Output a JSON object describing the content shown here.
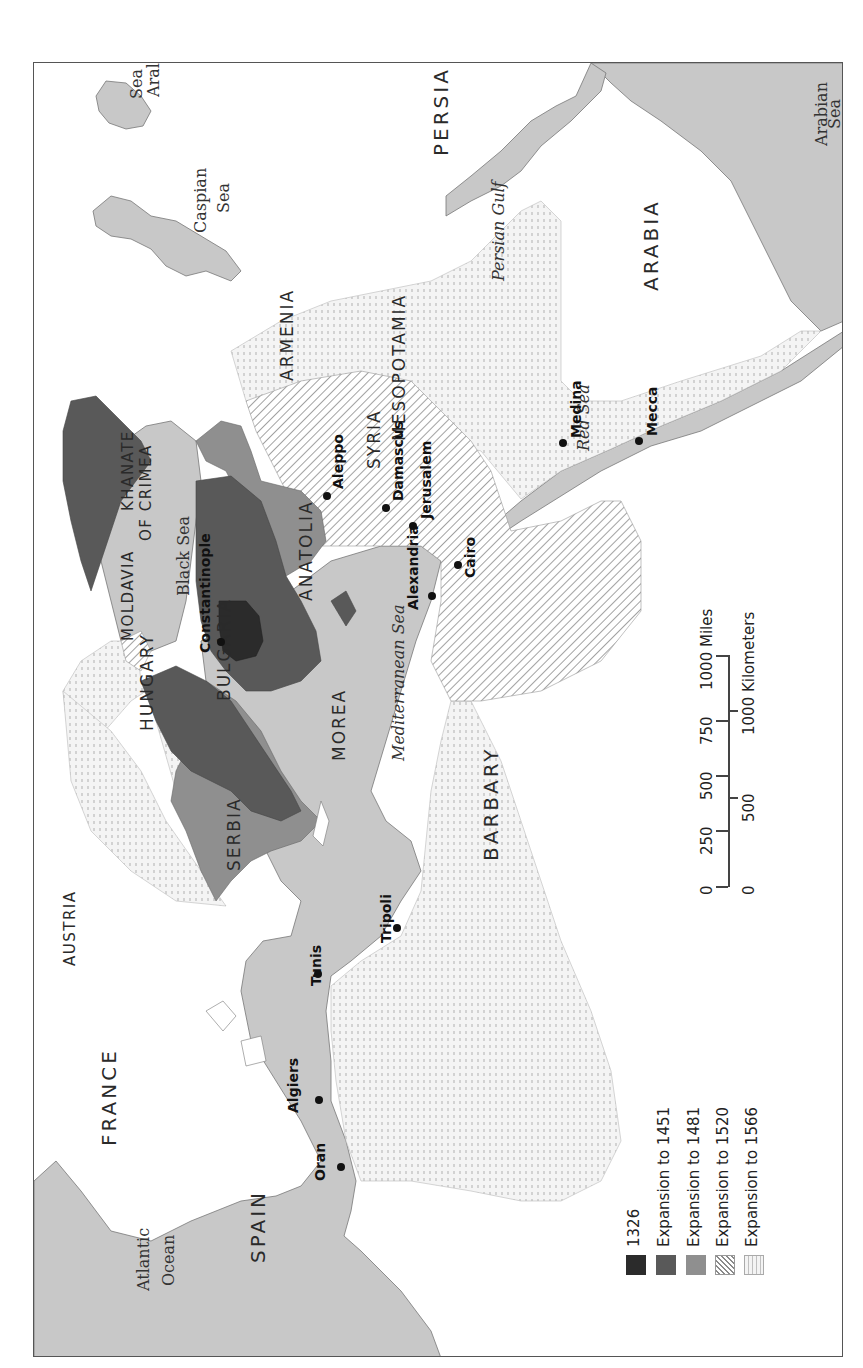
{
  "map": {
    "title_hidden": "",
    "orientation": "rotated-90-ccw",
    "colors": {
      "land": "#ffffff",
      "water": "#c8c8c8",
      "c1326": "#2b2b2b",
      "c1451": "#595959",
      "c1481": "#8f8f8f",
      "border": "#555555"
    },
    "regions": [
      {
        "name": "PERSIA",
        "x": 430,
        "y": 155,
        "cls": "big"
      },
      {
        "name": "ARABIA",
        "x": 640,
        "y": 290,
        "cls": "big"
      },
      {
        "name": "MESOPOTAMIA",
        "x": 390,
        "y": 440,
        "cls": ""
      },
      {
        "name": "ARMENIA",
        "x": 278,
        "y": 380,
        "cls": ""
      },
      {
        "name": "SYRIA",
        "x": 365,
        "y": 468,
        "cls": ""
      },
      {
        "name": "KHANATE",
        "x": 120,
        "y": 510,
        "cls": "sm"
      },
      {
        "name": "OF CRIMEA",
        "x": 138,
        "y": 540,
        "cls": "sm"
      },
      {
        "name": "ANATOLIA",
        "x": 297,
        "y": 600,
        "cls": ""
      },
      {
        "name": "MOLDAVIA",
        "x": 120,
        "y": 640,
        "cls": "sm"
      },
      {
        "name": "HUNGARY",
        "x": 138,
        "y": 730,
        "cls": ""
      },
      {
        "name": "BULGARIA",
        "x": 215,
        "y": 700,
        "cls": ""
      },
      {
        "name": "MOREA",
        "x": 330,
        "y": 760,
        "cls": ""
      },
      {
        "name": "SERBIA",
        "x": 225,
        "y": 870,
        "cls": ""
      },
      {
        "name": "AUSTRIA",
        "x": 62,
        "y": 965,
        "cls": "sm"
      },
      {
        "name": "BARBARY",
        "x": 480,
        "y": 860,
        "cls": "big"
      },
      {
        "name": "FRANCE",
        "x": 98,
        "y": 1145,
        "cls": "big"
      },
      {
        "name": "SPAIN",
        "x": 247,
        "y": 1262,
        "cls": "big"
      }
    ],
    "seas": [
      {
        "name": "Aral",
        "x": 145,
        "y": 96,
        "it": false
      },
      {
        "name": "Sea",
        "x": 128,
        "y": 98,
        "it": false
      },
      {
        "name": "Caspian",
        "x": 192,
        "y": 232,
        "it": false
      },
      {
        "name": "Sea",
        "x": 215,
        "y": 212,
        "it": false
      },
      {
        "name": "Persian Gulf",
        "x": 490,
        "y": 280,
        "it": true
      },
      {
        "name": "Arabian",
        "x": 813,
        "y": 145,
        "it": false
      },
      {
        "name": "Sea",
        "x": 826,
        "y": 128,
        "it": false
      },
      {
        "name": "Red Sea",
        "x": 575,
        "y": 450,
        "it": true
      },
      {
        "name": "Black Sea",
        "x": 175,
        "y": 595,
        "it": false
      },
      {
        "name": "Mediterranean Sea",
        "x": 390,
        "y": 760,
        "it": true
      },
      {
        "name": "Atlantic",
        "x": 135,
        "y": 1290,
        "it": false
      },
      {
        "name": "Ocean",
        "x": 160,
        "y": 1285,
        "it": false
      }
    ],
    "cities": [
      {
        "name": "Medina",
        "dot_x": 562,
        "dot_y": 442,
        "x": 568,
        "y": 437
      },
      {
        "name": "Mecca",
        "dot_x": 638,
        "dot_y": 440,
        "x": 644,
        "y": 435
      },
      {
        "name": "Aleppo",
        "dot_x": 326,
        "dot_y": 495,
        "x": 330,
        "y": 488
      },
      {
        "name": "Damascus",
        "dot_x": 385,
        "dot_y": 507,
        "x": 390,
        "y": 500
      },
      {
        "name": "Jerusalem",
        "dot_x": 412,
        "dot_y": 525,
        "x": 418,
        "y": 518
      },
      {
        "name": "Cairo",
        "dot_x": 457,
        "dot_y": 564,
        "x": 462,
        "y": 577
      },
      {
        "name": "Alexandria",
        "dot_x": 431,
        "dot_y": 595,
        "x": 405,
        "y": 609
      },
      {
        "name": "Constantinople",
        "dot_x": 220,
        "dot_y": 641,
        "x": 197,
        "y": 652
      },
      {
        "name": "Tripoli",
        "dot_x": 396,
        "dot_y": 927,
        "x": 378,
        "y": 942
      },
      {
        "name": "Tunis",
        "dot_x": 317,
        "dot_y": 973,
        "x": 308,
        "y": 985
      },
      {
        "name": "Algiers",
        "dot_x": 318,
        "dot_y": 1099,
        "x": 285,
        "y": 1112
      },
      {
        "name": "Oran",
        "dot_x": 340,
        "dot_y": 1166,
        "x": 312,
        "y": 1180
      }
    ]
  },
  "legend": {
    "items": [
      {
        "label": "1326",
        "key": "1326"
      },
      {
        "label": "Expansion to 1451",
        "key": "1451"
      },
      {
        "label": "Expansion to 1481",
        "key": "1481"
      },
      {
        "label": "Expansion to 1520",
        "key": "1520"
      },
      {
        "label": "Expansion to 1566",
        "key": "1566"
      }
    ]
  },
  "scale_bar": {
    "miles_label": "1000 Miles",
    "km_label": "1000 Kilometers",
    "miles_ticks": [
      "0",
      "250",
      "500",
      "750"
    ],
    "km_ticks": [
      "0",
      "500"
    ]
  }
}
